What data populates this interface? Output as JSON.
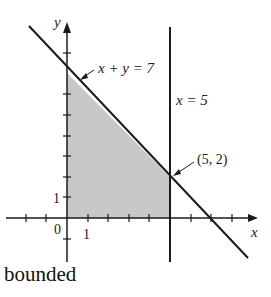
{
  "diagram": {
    "type": "linear-inequality-feasible-region",
    "x_axis_label": "x",
    "y_axis_label": "y",
    "origin_label": "0",
    "x_tick_label": "1",
    "y_tick_label": "1",
    "line1_label": "x + y = 7",
    "line2_label": "x = 5",
    "point_label": "(5, 2)",
    "region_color": "#c8c8c8",
    "line_color": "#1a1a1a"
  },
  "caption": "bounded"
}
